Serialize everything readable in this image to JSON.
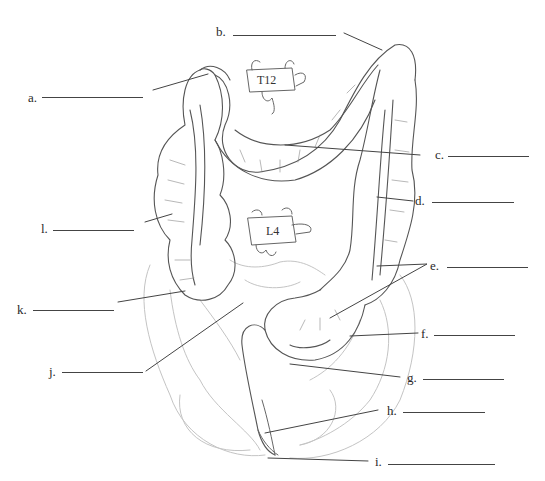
{
  "diagram": {
    "type": "anatomy-labeling-worksheet",
    "vertebrae": [
      {
        "id": "t12",
        "text": "T12"
      },
      {
        "id": "l4",
        "text": "L4"
      }
    ],
    "labels": [
      {
        "id": "a",
        "text": "a."
      },
      {
        "id": "b",
        "text": "b."
      },
      {
        "id": "c",
        "text": "c."
      },
      {
        "id": "d",
        "text": "d."
      },
      {
        "id": "e",
        "text": "e."
      },
      {
        "id": "f",
        "text": "f."
      },
      {
        "id": "g",
        "text": "g."
      },
      {
        "id": "h",
        "text": "h."
      },
      {
        "id": "i",
        "text": "i."
      },
      {
        "id": "j",
        "text": "j."
      },
      {
        "id": "k",
        "text": "k."
      },
      {
        "id": "l",
        "text": "l."
      }
    ],
    "colors": {
      "background": "#ffffff",
      "line": "#444444",
      "drawing": "#555555",
      "faint": "#bbbbbb"
    }
  }
}
